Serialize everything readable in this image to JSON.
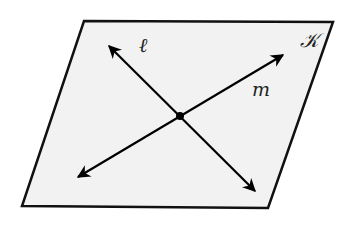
{
  "diagram": {
    "type": "geometry-plane-intersecting-lines",
    "plane": {
      "label": "𝒦",
      "fill": "#f2f2f2",
      "stroke": "#111111",
      "corners": {
        "top_left": [
          84,
          21
        ],
        "top_right": [
          333,
          22
        ],
        "bottom_right": [
          268,
          208
        ],
        "bottom_left": [
          22,
          206
        ]
      }
    },
    "intersection_point": {
      "x": 180,
      "y": 116,
      "color": "#000000"
    },
    "lines": [
      {
        "name": "l",
        "label": "ℓ",
        "label_pos": [
          143,
          50
        ],
        "end_a": [
          109,
          46
        ],
        "end_b": [
          255,
          191
        ]
      },
      {
        "name": "m",
        "label": "m",
        "label_pos": [
          258,
          94
        ],
        "end_a": [
          283,
          55
        ],
        "end_b": [
          78,
          177
        ]
      }
    ]
  }
}
